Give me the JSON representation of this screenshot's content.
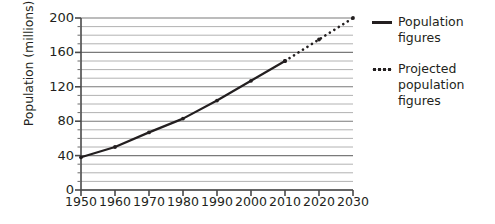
{
  "chart_data": {
    "type": "line",
    "title": "",
    "xlabel": "",
    "ylabel": "Population (millions)",
    "xlim": [
      1950,
      2030
    ],
    "ylim": [
      0,
      200
    ],
    "ytick_step": 40,
    "yminor_step": 10,
    "grid": true,
    "grid_minor": true,
    "legend_position": "right",
    "x": [
      1950,
      1960,
      1970,
      1980,
      1990,
      2000,
      2010,
      2020,
      2030
    ],
    "xtick_labels": [
      "1950",
      "1960",
      "1970",
      "1980",
      "1990",
      "2000",
      "2010",
      "2020",
      "2030"
    ],
    "ytick_labels": [
      "0",
      "40",
      "80",
      "120",
      "160",
      "200"
    ],
    "ytick_values": [
      0,
      40,
      80,
      120,
      160,
      200
    ],
    "series": [
      {
        "name": "Population figures",
        "style": "solid",
        "color": "#231f20",
        "x": [
          1950,
          1960,
          1970,
          1980,
          1990,
          2000,
          2010
        ],
        "values": [
          38,
          50,
          67,
          83,
          104,
          127,
          150
        ]
      },
      {
        "name": "Projected population figures",
        "style": "dotted",
        "color": "#231f20",
        "x": [
          2010,
          2020,
          2030
        ],
        "values": [
          150,
          175,
          200
        ]
      }
    ]
  },
  "legend": {
    "items": [
      {
        "label": "Population figures",
        "key": "solid-line-key"
      },
      {
        "label": "Projected population figures",
        "key": "dotted-line-key"
      }
    ]
  },
  "axes": {
    "y_title": "Population (millions)"
  }
}
